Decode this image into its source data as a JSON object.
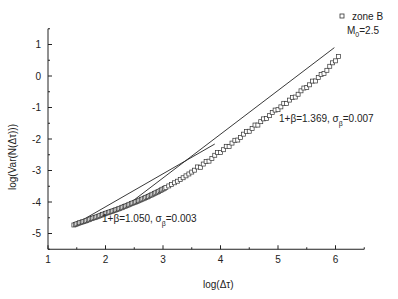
{
  "chart_data": {
    "type": "scatter",
    "title": "",
    "xlabel": "log(Δτ)",
    "ylabel": "log(Var(N(Δτ)))",
    "xlim": [
      1,
      6.5
    ],
    "ylim": [
      -5.5,
      1.5
    ],
    "xticks": [
      1,
      2,
      3,
      4,
      5,
      6
    ],
    "yticks": [
      -5,
      -4,
      -3,
      -2,
      -1,
      0,
      1
    ],
    "grid": false,
    "legend": {
      "position": "top-right",
      "entries": [
        "zone B"
      ],
      "note": "M0=2.5"
    },
    "series": [
      {
        "name": "zone B",
        "marker": "square-open",
        "x": [
          1.45,
          1.55,
          1.65,
          1.75,
          1.85,
          1.95,
          2.05,
          2.15,
          2.25,
          2.35,
          2.45,
          2.55,
          2.65,
          2.75,
          2.85,
          2.95,
          3.05,
          3.15,
          3.25,
          3.35,
          3.45,
          3.55,
          3.65,
          3.75,
          3.85,
          3.95,
          4.05,
          4.15,
          4.25,
          4.35,
          4.45,
          4.55,
          4.65,
          4.75,
          4.85,
          4.95,
          5.05,
          5.15,
          5.25,
          5.35,
          5.45,
          5.55,
          5.65,
          5.75,
          5.85,
          5.95,
          6.05
        ],
        "y": [
          -4.73,
          -4.66,
          -4.6,
          -4.53,
          -4.47,
          -4.4,
          -4.33,
          -4.27,
          -4.2,
          -4.13,
          -4.05,
          -3.98,
          -3.9,
          -3.82,
          -3.73,
          -3.64,
          -3.54,
          -3.44,
          -3.34,
          -3.23,
          -3.11,
          -2.99,
          -2.86,
          -2.73,
          -2.6,
          -2.47,
          -2.34,
          -2.2,
          -2.06,
          -1.93,
          -1.8,
          -1.67,
          -1.52,
          -1.38,
          -1.24,
          -1.12,
          -0.98,
          -0.83,
          -0.7,
          -0.56,
          -0.42,
          -0.28,
          -0.12,
          0.03,
          0.2,
          0.38,
          0.62
        ]
      }
    ],
    "fits": [
      {
        "label_main": "1+β=1.050, σ",
        "label_sub": "β",
        "label_tail": "=0.003",
        "slope": 1.05,
        "x": [
          1.45,
          3.9
        ],
        "y": [
          -4.73,
          -2.16
        ]
      },
      {
        "label_main": "1+β=1.369, σ",
        "label_sub": "β",
        "label_tail": "=0.007",
        "slope": 1.369,
        "x": [
          2.45,
          5.98
        ],
        "y": [
          -4.0,
          0.9
        ]
      }
    ]
  },
  "legend": {
    "series_label": "zone B",
    "param_main": "M",
    "param_sub": "0",
    "param_tail": "=2.5"
  },
  "axes": {
    "xlabel": "log(Δτ)",
    "ylabel": "log(Var(N(Δτ)))"
  }
}
